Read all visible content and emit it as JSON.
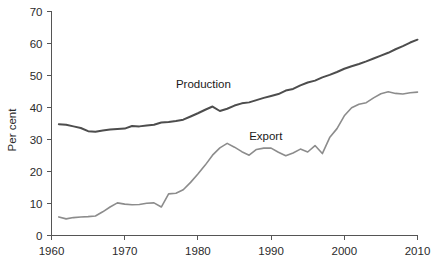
{
  "chart_data": {
    "type": "line",
    "title": "",
    "subtitle": "",
    "xlabel": "",
    "ylabel": "Per cent",
    "xlim": [
      1960,
      2010
    ],
    "ylim": [
      0,
      70
    ],
    "grid": false,
    "legend_position": "inline-annotation",
    "x_ticks": [
      "1960",
      "1970",
      "1980",
      "1990",
      "2000",
      "2010"
    ],
    "x_tick_values": [
      1960,
      1970,
      1980,
      1990,
      2000,
      2010
    ],
    "y_ticks": [
      "0",
      "10",
      "20",
      "30",
      "40",
      "50",
      "60",
      "70"
    ],
    "y_tick_values": [
      0,
      10,
      20,
      30,
      40,
      50,
      60,
      70
    ],
    "x": [
      1961,
      1962,
      1963,
      1964,
      1965,
      1966,
      1967,
      1968,
      1969,
      1970,
      1971,
      1972,
      1973,
      1974,
      1975,
      1976,
      1977,
      1978,
      1979,
      1980,
      1981,
      1982,
      1983,
      1984,
      1985,
      1986,
      1987,
      1988,
      1989,
      1990,
      1991,
      1992,
      1993,
      1994,
      1995,
      1996,
      1997,
      1998,
      1999,
      2000,
      2001,
      2002,
      2003,
      2004,
      2005,
      2006,
      2007,
      2008,
      2009,
      2010
    ],
    "series": [
      {
        "name": "Production",
        "color": "#4d4d4d",
        "label_x": 1977,
        "label_y": 46,
        "values": [
          34.8,
          34.6,
          34.1,
          33.6,
          32.6,
          32.4,
          32.8,
          33.1,
          33.3,
          33.4,
          34.2,
          34.1,
          34.4,
          34.6,
          35.3,
          35.5,
          35.8,
          36.2,
          37.2,
          38.2,
          39.3,
          40.3,
          38.9,
          39.6,
          40.6,
          41.3,
          41.6,
          42.3,
          43.0,
          43.6,
          44.2,
          45.3,
          45.8,
          46.9,
          47.8,
          48.4,
          49.4,
          50.2,
          51.1,
          52.1,
          52.9,
          53.6,
          54.4,
          55.3,
          56.2,
          57.1,
          58.2,
          59.2,
          60.3,
          61.2
        ]
      },
      {
        "name": "Export",
        "color": "#8c8c8c",
        "label_x": 1987,
        "label_y": 30,
        "values": [
          5.8,
          5.2,
          5.6,
          5.8,
          5.9,
          6.1,
          7.4,
          8.9,
          10.2,
          9.8,
          9.6,
          9.7,
          10.1,
          10.2,
          8.9,
          13.0,
          13.2,
          14.3,
          16.6,
          19.2,
          22.0,
          25.1,
          27.4,
          28.8,
          27.6,
          26.2,
          25.1,
          26.9,
          27.3,
          27.3,
          26.0,
          24.9,
          25.8,
          27.0,
          26.1,
          28.1,
          25.6,
          30.6,
          33.4,
          37.4,
          39.9,
          41.0,
          41.5,
          43.0,
          44.3,
          44.9,
          44.4,
          44.2,
          44.6,
          44.8
        ]
      }
    ]
  }
}
